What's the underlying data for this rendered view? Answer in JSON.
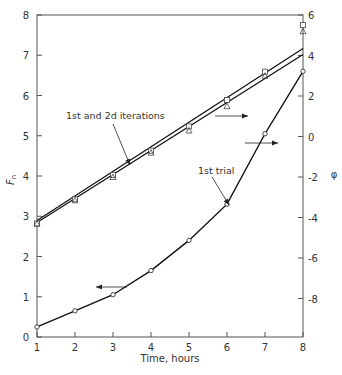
{
  "chart_data": {
    "type": "line",
    "title": "",
    "xlabel": "Time, hours",
    "ylabel": "F_n",
    "ylabel_right": "φ",
    "x": [
      1,
      2,
      3,
      4,
      5,
      6,
      7,
      8
    ],
    "xlim": [
      1,
      8
    ],
    "ylim": [
      0,
      8
    ],
    "ylim_right": [
      -10,
      6
    ],
    "x_ticks": [
      "1",
      "2",
      "3",
      "4",
      "5",
      "6",
      "7",
      "8"
    ],
    "y_ticks": [
      "0",
      "1",
      "2",
      "3",
      "4",
      "5",
      "6",
      "7",
      "8"
    ],
    "y_right_ticks": [
      "6",
      "4",
      "2",
      "0",
      "-2",
      "-4",
      "-6",
      "-8"
    ],
    "grid": false,
    "legend": null,
    "series": [
      {
        "name": "1st trial",
        "axis": "left",
        "marker": "circle",
        "values": [
          0.25,
          0.65,
          1.05,
          1.65,
          2.4,
          3.3,
          5.05,
          6.6
        ]
      },
      {
        "name": "1st iteration",
        "axis": "right",
        "marker": "square",
        "values": [
          -4.3,
          -3.1,
          -1.9,
          -0.7,
          0.5,
          1.8,
          3.2,
          5.5
        ]
      },
      {
        "name": "2d iteration",
        "axis": "right",
        "marker": "triangle",
        "values": [
          -4.3,
          -3.15,
          -2.0,
          -0.8,
          0.3,
          1.5,
          3.0,
          5.2
        ]
      },
      {
        "name": "1st and 2d iterations (fitted lines)",
        "axis": "right",
        "marker": "none",
        "values": [
          -4.2,
          -3.05,
          -1.9,
          -0.75,
          0.45,
          1.65,
          2.85,
          4.2
        ]
      }
    ],
    "annotations": [
      {
        "text": "1st and 2d iterations",
        "points_to": "upper double line near x=3.5"
      },
      {
        "text": "1st trial",
        "points_to": "lower curve near x=6"
      },
      {
        "text": "arrow left",
        "meaning": "lower curve reads on left axis (F_n)",
        "at": [
          3.4,
          1.3
        ]
      },
      {
        "text": "arrow right",
        "meaning": "upper lines read on right axis (φ)",
        "at": [
          5.5,
          0.5
        ]
      },
      {
        "text": "arrow right",
        "meaning": "upper lines read on right axis (φ)",
        "at": [
          6.5,
          1.5
        ]
      }
    ]
  },
  "labels": {
    "x_title": "Time, hours",
    "y_left_title": "F",
    "y_left_sub": "n",
    "y_right_title": "φ",
    "annotation_iterations": "1st and 2d iterations",
    "annotation_trial": "1st trial"
  }
}
